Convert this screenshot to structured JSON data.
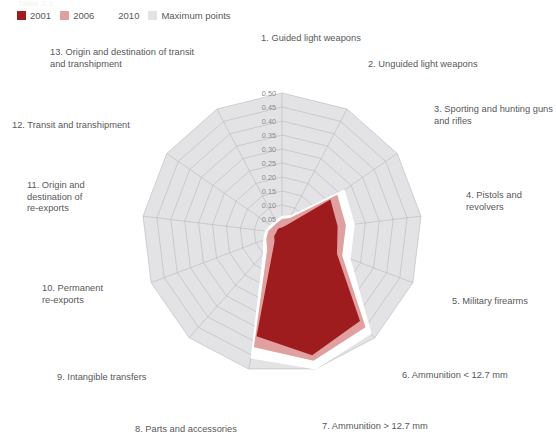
{
  "supratitle": "Table 3.1",
  "legend": {
    "items": [
      {
        "label": "2001",
        "color": "#9e1b1e"
      },
      {
        "label": "2006",
        "color": "#e0a0a0"
      },
      {
        "label": "2010",
        "color": "#ffffff"
      },
      {
        "label": "Maximum points",
        "color": "#e3e3e5"
      }
    ]
  },
  "chart_data": {
    "type": "radar",
    "title": "",
    "categories": [
      "1. Guided light weapons",
      "2. Unguided light weapons",
      "3. Sporting and hunting guns and rifles",
      "4. Pistols and revolvers",
      "5. Military firearms",
      "6. Ammunition < 12.7 mm",
      "7. Ammunition > 12.7 mm",
      "8. Parts and accessories",
      "9. Intangible transfers",
      "10. Permanent re-exports",
      "11. Origin and destination of re-exports",
      "12. Transit and transhipment",
      "13. Origin and destination of transit and transhipment"
    ],
    "category_labels_display": [
      "1. Guided light weapons",
      "2. Unguided light weapons",
      "3. Sporting and hunting guns\nand rifles",
      "4. Pistols and\nrevolvers",
      "5. Military firearms",
      "6. Ammunition < 12.7 mm",
      "7. Ammunition > 12.7 mm",
      "8. Parts and accessories",
      "9. Intangible transfers",
      "10. Permanent\nre-exports",
      "11. Origin and\ndestination of\nre-exports",
      "12. Transit and transhipment",
      "13. Origin and destination of transit\nand transhipment"
    ],
    "tick_labels": [
      "0.05",
      "0.10",
      "0.15",
      "0.20",
      "0.25",
      "0.30",
      "0.35",
      "0.40",
      "0.45",
      "0.50"
    ],
    "tick_values": [
      0.05,
      0.1,
      0.15,
      0.2,
      0.25,
      0.3,
      0.35,
      0.4,
      0.45,
      0.5
    ],
    "rlim": [
      0,
      0.5
    ],
    "grid": true,
    "legend_position": "top-left",
    "series": [
      {
        "name": "Maximum points",
        "color": "#e3e3e5",
        "values": [
          0.5,
          0.5,
          0.5,
          0.5,
          0.5,
          0.5,
          0.5,
          0.5,
          0.5,
          0.5,
          0.5,
          0.5,
          0.5
        ]
      },
      {
        "name": "2010",
        "color": "#ffffff",
        "values": [
          0.06,
          0.07,
          0.27,
          0.26,
          0.26,
          0.48,
          0.5,
          0.46,
          0.1,
          0.07,
          0.06,
          0.05,
          0.05
        ]
      },
      {
        "name": "2006",
        "color": "#e0a0a0",
        "values": [
          0.05,
          0.06,
          0.24,
          0.23,
          0.23,
          0.45,
          0.47,
          0.42,
          0.08,
          0.06,
          0.05,
          0.04,
          0.04
        ]
      },
      {
        "name": "2001",
        "color": "#9e1b1e",
        "values": [
          0.02,
          0.03,
          0.21,
          0.2,
          0.21,
          0.42,
          0.45,
          0.38,
          0.04,
          0.03,
          0.02,
          0.02,
          0.02
        ]
      }
    ]
  }
}
